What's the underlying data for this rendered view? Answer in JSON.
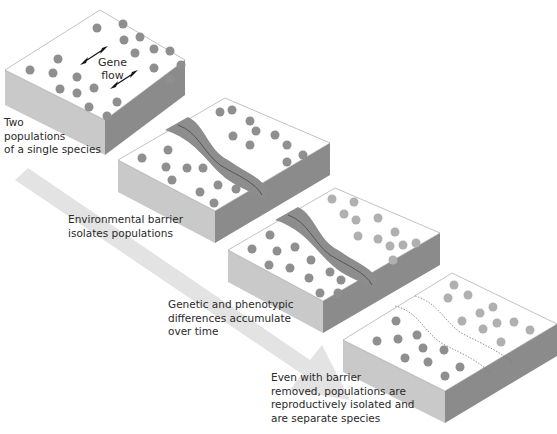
{
  "diagram": {
    "colors": {
      "slab_top": "#ffffff",
      "slab_left": "#c8c8c8",
      "slab_right": "#8a8a8a",
      "dot_dark": "#8c8c8c",
      "dot_light": "#b0b0b0",
      "barrier_fill": "#8f8f8f",
      "barrier_dark": "#6e6e6e",
      "arrow": "#e2e2e2"
    },
    "gene_flow": {
      "line1": "Gene",
      "line2": "flow"
    },
    "stages": [
      {
        "id": "stage-1",
        "label_lines": [
          "Two",
          "populations",
          "of a single species"
        ]
      },
      {
        "id": "stage-2",
        "label_lines": [
          "Environmental barrier",
          "isolates populations"
        ]
      },
      {
        "id": "stage-3",
        "label_lines": [
          "Genetic and phenotypic",
          "differences accumulate",
          "over time"
        ]
      },
      {
        "id": "stage-4",
        "label_lines": [
          "Even with barrier",
          "removed, populations are",
          "reproductively isolated and",
          "are separate species"
        ]
      }
    ]
  }
}
